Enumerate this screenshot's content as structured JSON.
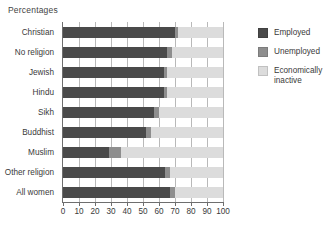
{
  "title": "Percentages",
  "legend": {
    "items": [
      {
        "label": "Employed",
        "color": "#4a4a4a",
        "key": "employed"
      },
      {
        "label": "Unemployed",
        "color": "#8e8e8e",
        "key": "unemployed"
      },
      {
        "label": "Economically inactive",
        "color": "#dcdcdc",
        "key": "inactive"
      }
    ]
  },
  "axis": {
    "ticks": [
      "0",
      "10",
      "20",
      "30",
      "40",
      "50",
      "60",
      "70",
      "80",
      "90",
      "100"
    ]
  },
  "chart_data": {
    "type": "bar",
    "orientation": "horizontal",
    "stacked": true,
    "title": "Percentages",
    "xlabel": "",
    "ylabel": "",
    "xlim": [
      0,
      100
    ],
    "grid": true,
    "legend_position": "right",
    "categories": [
      "Christian",
      "No religion",
      "Jewish",
      "Hindu",
      "Sikh",
      "Buddhist",
      "Muslim",
      "Other religion",
      "All women"
    ],
    "series": [
      {
        "name": "Employed",
        "values": [
          70,
          65,
          63,
          63,
          57,
          52,
          29,
          64,
          67
        ]
      },
      {
        "name": "Unemployed",
        "values": [
          2,
          3,
          2,
          2,
          3,
          3,
          7,
          3,
          3
        ]
      },
      {
        "name": "Economically inactive",
        "values": [
          28,
          32,
          35,
          35,
          40,
          45,
          64,
          33,
          30
        ]
      }
    ]
  }
}
